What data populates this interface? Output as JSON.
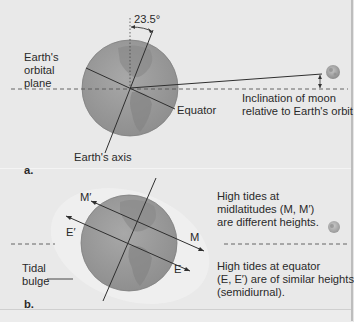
{
  "panel_a": {
    "angle_label": "23.5°",
    "orbital_plane_label": [
      "Earth's",
      "orbital",
      "plane"
    ],
    "equator_label": "Equator",
    "inclination_label": [
      "Inclination of moon",
      "relative to Earth's orbit"
    ],
    "axis_label": "Earth's axis",
    "panel_letter": "a."
  },
  "panel_b": {
    "m_prime_label": "M′",
    "e_prime_label": "E′",
    "m_label": "M",
    "e_label": "E",
    "tidal_bulge_label": [
      "Tidal",
      "bulge"
    ],
    "midlatitude_note": [
      "High tides at",
      "midlatitudes (M, M′)",
      "are different heights."
    ],
    "equator_note": [
      "High tides at equator",
      "(E, E′) are of similar heights",
      "(semidiurnal)."
    ],
    "panel_letter": "b."
  },
  "colors": {
    "earth": "#9a9a9a",
    "earth_land": "#858585",
    "background": "#e9e9e9",
    "line": "#2f2f2f",
    "moon": "#a8a8a8"
  }
}
